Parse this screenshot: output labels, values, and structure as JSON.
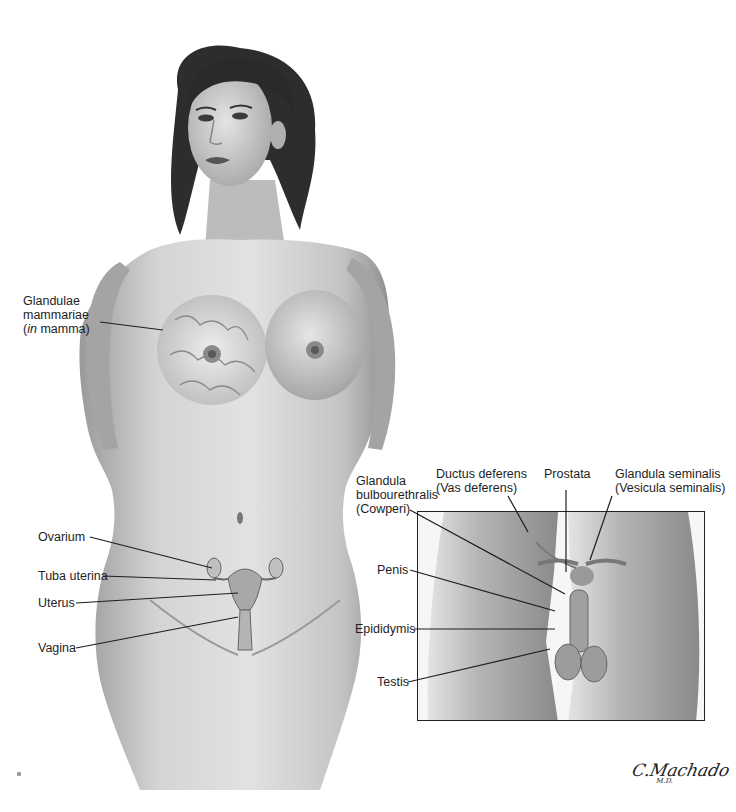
{
  "figure": {
    "female_labels": {
      "glandulae_mammariae": {
        "line1": "Glandulae",
        "line2": "mammariae",
        "line3_italic": "in",
        "line3_rest": " mamma)",
        "line3_open": "("
      },
      "ovarium": "Ovarium",
      "tuba_uterina": "Tuba uterina",
      "uterus": "Uterus",
      "vagina": "Vagina"
    },
    "male_labels": {
      "glandula_bulbourethralis": {
        "line1": "Glandula",
        "line2": "bulbourethralis",
        "line3": "(Cowperi)"
      },
      "ductus_deferens": {
        "line1": "Ductus deferens",
        "line2": "(Vas deferens)"
      },
      "prostata": "Prostata",
      "glandula_seminalis": {
        "line1": "Glandula seminalis",
        "line2": "(Vesicula seminalis)"
      },
      "penis": "Penis",
      "epididymis": "Epididymis",
      "testis": "Testis"
    },
    "signature": {
      "name": "C.Machado",
      "suffix": "M.D."
    },
    "colors": {
      "background": "#ffffff",
      "skin_light": "#d8d8d8",
      "skin_mid": "#b8b8b8",
      "skin_dark": "#8a8a8a",
      "hair": "#2a2a2a",
      "leader_line": "#1e1e1e",
      "text": "#1e1e1e"
    }
  }
}
